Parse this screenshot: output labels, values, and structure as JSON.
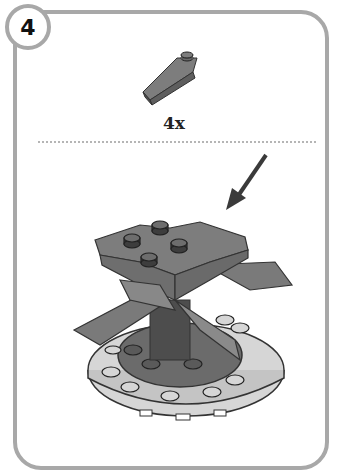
{
  "step": {
    "number": "4"
  },
  "parts_callout": {
    "part_icon": "slope-brick-1x3-icon",
    "quantity": "4x"
  },
  "build": {
    "arrow_icon": "placement-arrow-icon",
    "model_icon": "assembled-model-icon"
  },
  "colors": {
    "frame": "#a8a8a8",
    "brick_gray": "#7a7a7a",
    "brick_dark": "#555555",
    "plate_light": "#d9d9d9"
  }
}
